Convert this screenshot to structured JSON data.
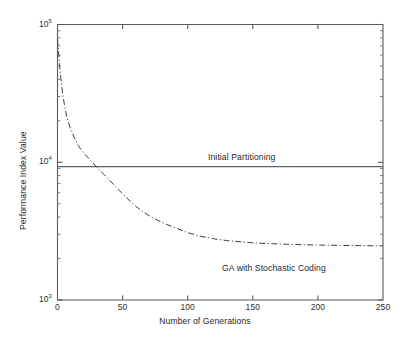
{
  "chart_data": {
    "type": "line",
    "title": "",
    "xlabel": "Number of Generations",
    "ylabel": "Performance Index Value",
    "xlim": [
      0,
      250
    ],
    "ylim": [
      1000,
      100000
    ],
    "yscale": "log",
    "xscale": "linear",
    "grid": false,
    "legend_position": "inline-annotations",
    "xticks": [
      0,
      50,
      100,
      150,
      200,
      250
    ],
    "xtick_labels": [
      "0",
      "50",
      "100",
      "150",
      "200",
      "250"
    ],
    "yticks": [
      1000,
      10000,
      100000
    ],
    "ytick_labels": [
      "10",
      "10",
      "10"
    ],
    "ytick_exponents": [
      "3",
      "4",
      "5"
    ],
    "series": [
      {
        "name": "Initial Partitioning",
        "style": "solid",
        "annotation": "Initial Partitioning",
        "x": [
          0,
          250
        ],
        "values": [
          9300,
          9300
        ]
      },
      {
        "name": "GA with Stochastic Coding",
        "style": "dash-dot",
        "annotation": "GA with Stochastic Coding",
        "x": [
          0,
          2,
          4,
          6,
          8,
          10,
          13,
          16,
          19,
          22,
          25,
          28,
          32,
          36,
          40,
          45,
          50,
          55,
          60,
          66,
          72,
          78,
          85,
          92,
          100,
          110,
          120,
          130,
          145,
          160,
          175,
          190,
          205,
          220,
          235,
          250
        ],
        "values": [
          78000,
          46000,
          31000,
          24000,
          20000,
          17500,
          15000,
          13200,
          12000,
          11200,
          10400,
          9700,
          8800,
          8100,
          7400,
          6600,
          5900,
          5300,
          4800,
          4350,
          4000,
          3750,
          3500,
          3300,
          3080,
          2900,
          2780,
          2700,
          2620,
          2570,
          2540,
          2520,
          2500,
          2490,
          2480,
          2470
        ]
      }
    ]
  },
  "annotations": {
    "initial_partitioning": "Initial Partitioning",
    "ga_stochastic": "GA with Stochastic Coding"
  },
  "axes": {
    "x_title": "Number of Generations",
    "y_title": "Performance Index Value"
  }
}
